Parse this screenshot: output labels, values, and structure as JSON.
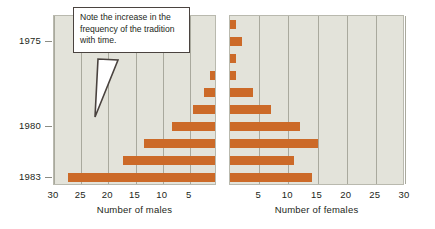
{
  "figure": {
    "kind": "back-to-back-bar-chart",
    "annotation": {
      "text": "Note the increase in the frequency of the tradition with time.",
      "border_color": "#4a433f",
      "background": "#ffffff"
    }
  },
  "chart_data": {
    "type": "bar",
    "title": "",
    "orientation": "horizontal",
    "layout": "back-to-back population pyramid, two panels sharing a year (category) axis",
    "grid": true,
    "legend": null,
    "ylabel": "",
    "y_tick_labels": [
      "1975",
      "1980",
      "1983"
    ],
    "y_axis_note": "years increase downward; rows are successive years from 1974 at top to 1983 at bottom",
    "categories": [
      "1974",
      "1975",
      "1976",
      "1977",
      "1978",
      "1979",
      "1980",
      "1981",
      "1982",
      "1983"
    ],
    "panels": [
      {
        "name": "males",
        "xlabel": "Number of males",
        "xlim": [
          30,
          0
        ],
        "x_tick_labels": [
          "30",
          "25",
          "20",
          "15",
          "10",
          "5"
        ],
        "x_ticks": [
          30,
          25,
          20,
          15,
          10,
          5
        ],
        "direction": "right-to-left",
        "bar_color": "#cc6a28",
        "series": [
          {
            "name": "Number of males",
            "values": [
              0,
              0,
              0,
              1,
              2,
              4,
              8,
              13,
              17,
              27
            ]
          }
        ]
      },
      {
        "name": "females",
        "xlabel": "Number of females",
        "xlim": [
          0,
          30
        ],
        "x_tick_labels": [
          "5",
          "10",
          "15",
          "20",
          "25",
          "30"
        ],
        "x_ticks": [
          5,
          10,
          15,
          20,
          25,
          30
        ],
        "direction": "left-to-right",
        "bar_color": "#cc6a28",
        "series": [
          {
            "name": "Number of females",
            "values": [
              1,
              2,
              1,
              1,
              4,
              7,
              12,
              15,
              11,
              14
            ]
          }
        ]
      }
    ],
    "colors": {
      "bar": "#cc6a28",
      "panel_background": "#e3e3da",
      "gridline": "#a9a99d",
      "panel_border": "#b9b9ae",
      "text": "#231f20"
    }
  }
}
